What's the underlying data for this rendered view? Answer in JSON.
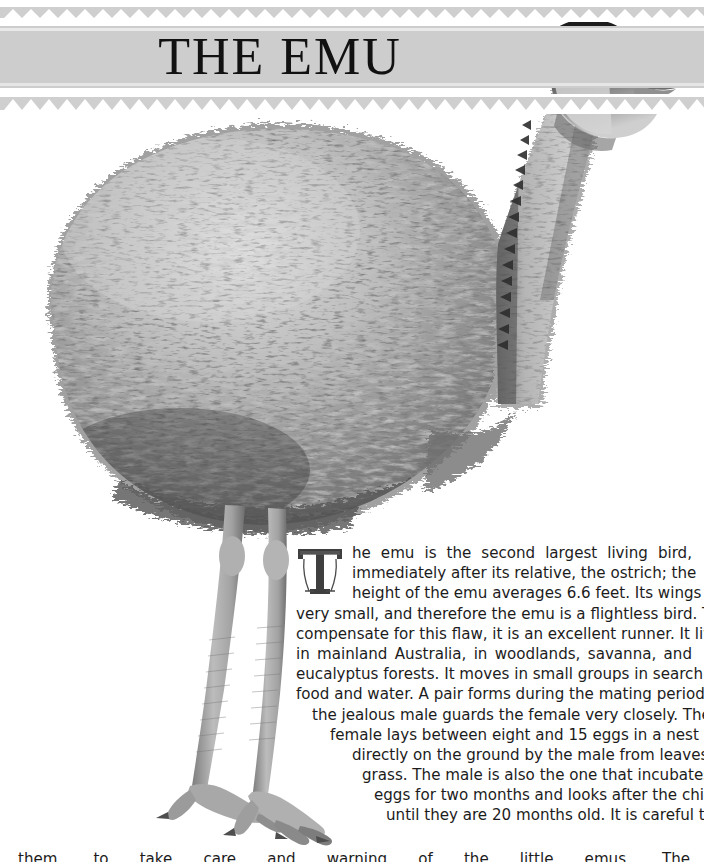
{
  "page": {
    "width": 704,
    "height": 862,
    "background": "#ffffff"
  },
  "header": {
    "title": "THE EMU",
    "band_color": "#cdcdcd",
    "zigzag_color": "#cfcfcf",
    "title_color": "#111111",
    "pattern": "triangle-zigzag"
  },
  "illustration": {
    "subject": "emu",
    "alt": "Grayscale photograph of a standing emu in profile, facing right",
    "style": "black-and-white photograph",
    "colors": {
      "plumage_dark": "#2a2a2a",
      "plumage_mid": "#8d8d8d",
      "plumage_light": "#d9d9d9",
      "neck": "#b8b8b8",
      "head_dark": "#1e1e1e",
      "beak": "#7a7a7a",
      "leg": "#9a9a9a",
      "background": "#ffffff"
    }
  },
  "article": {
    "dropcap": "T",
    "dropcap_color": "#3a3a3a",
    "text_color": "#1c1c1c",
    "lines": [
      "he emu is the second largest living bird,",
      "immediately after its relative, the ostrich; the",
      "height of the emu averages 6.6 feet. Its wings are",
      "very small, and therefore the emu is a flightless bird. To",
      "compensate for this flaw, it is an excellent runner. It lives",
      "in mainland Australia, in woodlands, savanna, and",
      "eucalyptus forests. It moves in small groups in search of",
      "food and water. A pair forms during the mating period, and",
      "the jealous male guards the female very closely. The",
      "female lays between eight and 15 eggs in a nest built",
      "directly on the ground by the male from leaves and",
      "grass. The male is also the one that incubates the",
      "eggs for two months and looks after the chicks",
      "until they are 20 months old. It is careful to"
    ],
    "clipped_last_line": "them, to take care and warning of the little emus. The",
    "full_text": "The emu is the second largest living bird, immediately after its relative, the ostrich; the height of the emu averages 6.6 feet. Its wings are very small, and therefore the emu is a flightless bird. To compensate for this flaw, it is an excellent runner. It lives in mainland Australia, in woodlands, savanna, and eucalyptus forests. It moves in small groups in search of food and water. A pair forms during the mating period, and the jealous male guards the female very closely. The female lays between eight and 15 eggs in a nest built directly on the ground by the male from leaves and grass. The male is also the one that incubates the eggs for two months and looks after the chicks until they are 20 months old. It is careful to",
    "facts": {
      "average_height_feet": 6.6,
      "eggs_min": 8,
      "eggs_max": 15,
      "incubation_months": 2,
      "chick_care_months": 20,
      "rank": "second largest living bird",
      "relative": "ostrich",
      "habitat": "mainland Australia, woodlands, savanna, eucalyptus forests"
    }
  }
}
